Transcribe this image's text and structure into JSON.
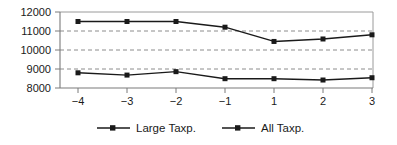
{
  "chart_data": {
    "type": "line",
    "title": "",
    "subtitle": "",
    "xlabel": "",
    "ylabel": "",
    "x": [
      -4,
      -3,
      -2,
      -1,
      1,
      2,
      3
    ],
    "xtick_labels": [
      "−4",
      "−3",
      "−2",
      "−1",
      "1",
      "2",
      "3"
    ],
    "ytick_labels": [
      "8000",
      "9000",
      "10000",
      "11000",
      "12000"
    ],
    "yticks": [
      8000,
      9000,
      10000,
      11000,
      12000
    ],
    "ylim": [
      8000,
      12000
    ],
    "grid": "horizontal-dashed",
    "legend_position": "bottom-center",
    "series": [
      {
        "name": "Large Taxp.",
        "values": [
          11500,
          11500,
          11500,
          11200,
          10450,
          10580,
          10800
        ],
        "color": "#1a1a1a",
        "marker": "square"
      },
      {
        "name": "All Taxp.",
        "values": [
          8800,
          8680,
          8860,
          8490,
          8490,
          8420,
          8540
        ],
        "color": "#1a1a1a",
        "marker": "square"
      }
    ]
  },
  "legend": {
    "items": [
      {
        "label": "Large Taxp."
      },
      {
        "label": "All Taxp."
      }
    ]
  },
  "axis": {
    "y_labels": [
      "12000",
      "11000",
      "10000",
      "9000",
      "8000"
    ],
    "x_labels": [
      "−4",
      "−3",
      "−2",
      "−1",
      "1",
      "2",
      "3"
    ]
  }
}
